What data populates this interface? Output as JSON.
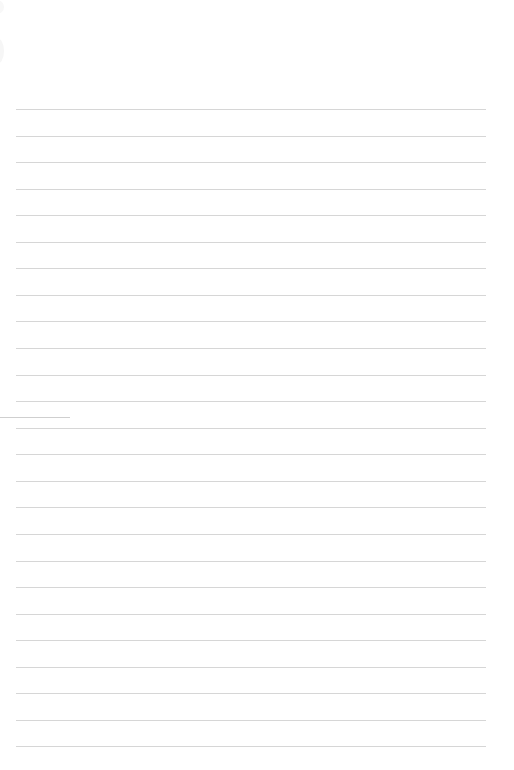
{
  "page": {
    "type": "lined-paper",
    "background_color": "#ffffff",
    "rule_color": "#d6d6d6",
    "rule_count": 25,
    "rule_spacing_px": 26.56,
    "first_rule_y": 109,
    "rule_left_x": 16,
    "rule_right_x": 486,
    "margin_mark": {
      "y": 417,
      "x_start": 0,
      "x_end": 70,
      "color": "#cfcfcf"
    }
  }
}
